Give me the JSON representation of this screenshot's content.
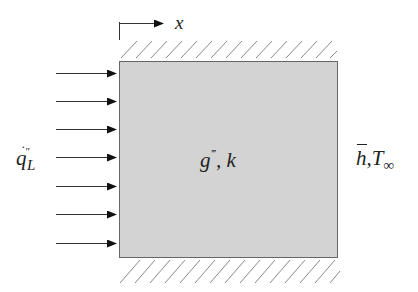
{
  "diagram": {
    "colors": {
      "background": "#ffffff",
      "wall_fill": "#d3d3d3",
      "wall_stroke": "#666666",
      "hatch": "#888888",
      "arrow": "#111111",
      "text": "#222222"
    },
    "wall": {
      "x": 119,
      "y": 61,
      "width": 218,
      "height": 196
    },
    "axis": {
      "label": "x",
      "origin": {
        "x": 119,
        "y": 23
      },
      "arrow_end_x": 163
    },
    "heat_flux_arrows": {
      "count": 7,
      "x_start": 56,
      "x_end": 116,
      "y_positions": [
        73,
        101,
        129,
        157,
        186,
        214,
        243
      ]
    },
    "labels": {
      "axis_x": "x",
      "generation": {
        "symbol": "g",
        "prime": "‴",
        "rest": ", k"
      },
      "left_flux": {
        "symbol": "q",
        "dot": "˙",
        "prime": "″",
        "subscript": "L"
      },
      "right_bc": {
        "symbol": "h",
        "rest": ",T",
        "subscript": "∞"
      }
    }
  }
}
